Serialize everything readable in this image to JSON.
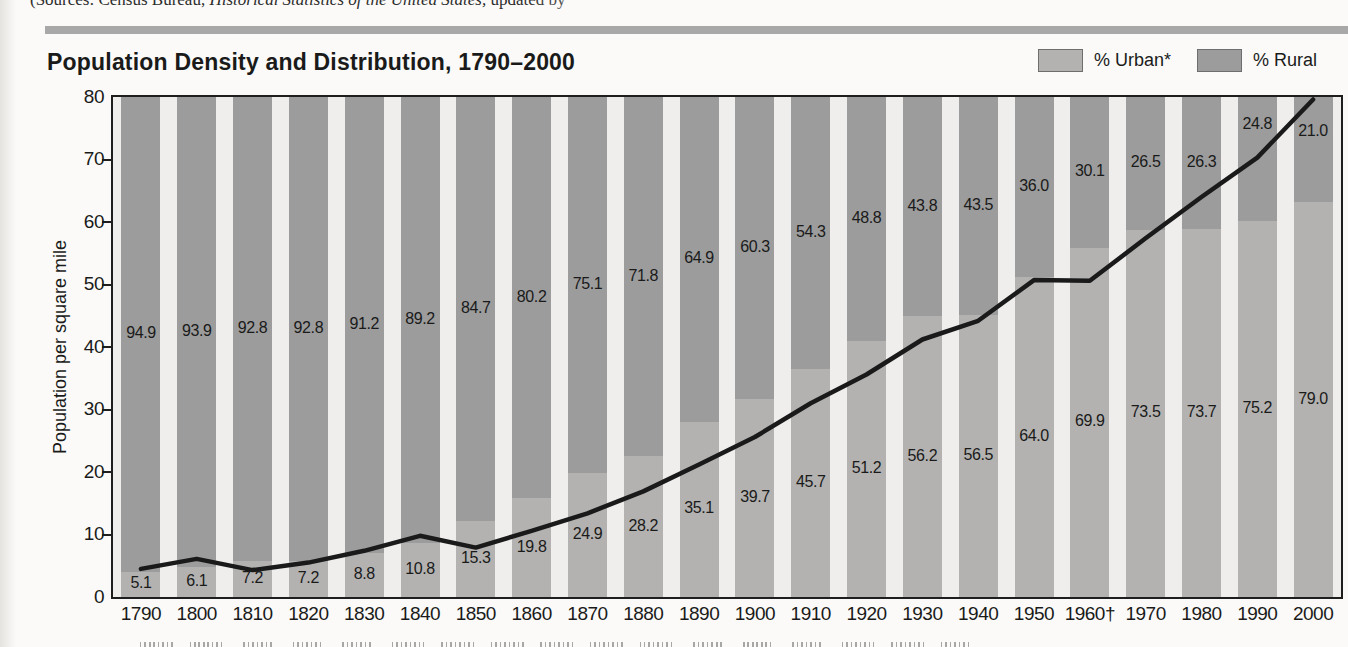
{
  "source": {
    "prefix": "(Sources: Census Bureau, ",
    "book_title": "Historical Statistics of the United States,",
    "suffix": " updated by"
  },
  "title": "Population Density and Distribution, 1790–2000",
  "legend": [
    {
      "label": "% Urban*",
      "color": "#b3b2b0"
    },
    {
      "label": "% Rural",
      "color": "#9c9c9c"
    }
  ],
  "chart_data": {
    "type": "bar",
    "subtype": "100-percent-stacked-columns-with-line-overlay",
    "title": "Population Density and Distribution, 1790–2000",
    "xlabel": "",
    "ylabel": "Population per square mile",
    "ylim": [
      0,
      80
    ],
    "y_ticks": [
      0,
      10,
      20,
      30,
      40,
      50,
      60,
      70,
      80
    ],
    "grid": false,
    "legend_position": "top-right",
    "categories": [
      "1790",
      "1800",
      "1810",
      "1820",
      "1830",
      "1840",
      "1850",
      "1860",
      "1870",
      "1880",
      "1890",
      "1900",
      "1910",
      "1920",
      "1930",
      "1940",
      "1950",
      "1960†",
      "1970",
      "1980",
      "1990",
      "2000"
    ],
    "series": [
      {
        "name": "% Urban*",
        "role": "bar-bottom-segment",
        "color": "#b3b2b0",
        "unit": "percent",
        "values": [
          5.1,
          6.1,
          7.2,
          7.2,
          8.8,
          10.8,
          15.3,
          19.8,
          24.9,
          28.2,
          35.1,
          39.7,
          45.7,
          51.2,
          56.2,
          56.5,
          64.0,
          69.9,
          73.5,
          73.7,
          75.2,
          79.0
        ],
        "labels": [
          "5.1",
          "6.1",
          "7.2",
          "7.2",
          "8.8",
          "10.8",
          "15.3",
          "19.8",
          "24.9",
          "28.2",
          "35.1",
          "39.7",
          "45.7",
          "51.2",
          "56.2",
          "56.5",
          "64.0",
          "69.9",
          "73.5",
          "73.7",
          "75.2",
          "79.0"
        ]
      },
      {
        "name": "% Rural",
        "role": "bar-top-segment",
        "color": "#9c9c9c",
        "unit": "percent",
        "values": [
          94.9,
          93.9,
          92.8,
          92.8,
          91.2,
          89.2,
          84.7,
          80.2,
          75.1,
          71.8,
          64.9,
          60.3,
          54.3,
          48.8,
          43.8,
          43.5,
          36.0,
          30.1,
          26.5,
          26.3,
          24.8,
          21.0
        ],
        "labels": [
          "94.9",
          "93.9",
          "92.8",
          "92.8",
          "91.2",
          "89.2",
          "84.7",
          "80.2",
          "75.1",
          "71.8",
          "64.9",
          "60.3",
          "54.3",
          "48.8",
          "43.8",
          "43.5",
          "36.0",
          "30.1",
          "26.5",
          "26.3",
          "24.8",
          "21.0"
        ]
      },
      {
        "name": "Population per square mile",
        "role": "line",
        "color": "#1a1a1a",
        "unit": "people per square mile",
        "values_estimated_from_plot": true,
        "values": [
          4.5,
          6.1,
          4.3,
          5.5,
          7.4,
          9.8,
          7.9,
          10.6,
          13.4,
          16.9,
          21.2,
          25.6,
          31.0,
          35.6,
          41.2,
          44.2,
          50.7,
          50.6,
          57.4,
          64.0,
          70.3,
          79.6
        ]
      }
    ]
  }
}
